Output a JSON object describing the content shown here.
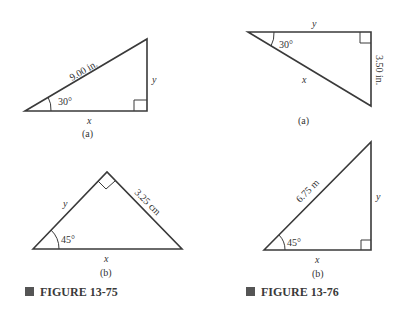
{
  "figures": [
    {
      "caption": "FIGURE 13-75",
      "parts": [
        {
          "label": "(a)",
          "hypotenuse": "9.00 in.",
          "angle": "30°",
          "horizontal": "x",
          "vertical": "y"
        },
        {
          "label": "(b)",
          "side": "3.25 cm",
          "angle": "45°",
          "base": "x",
          "other_side": "y"
        }
      ]
    },
    {
      "caption": "FIGURE 13-76",
      "parts": [
        {
          "label": "(a)",
          "vertical_side": "3.50 in.",
          "angle": "30°",
          "hypotenuse": "x",
          "top": "y"
        },
        {
          "label": "(b)",
          "hypotenuse": "6.75 m",
          "angle": "45°",
          "horizontal": "x",
          "vertical": "y"
        }
      ]
    }
  ],
  "colors": {
    "line": "#3a3a3a",
    "bullet": "#555555"
  }
}
